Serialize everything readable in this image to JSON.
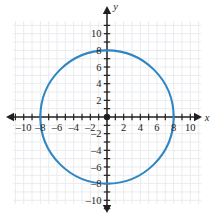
{
  "figure": {
    "title": "",
    "background_color": "#ffffff"
  },
  "chart_data": {
    "type": "scatter",
    "title": "",
    "subtitle": "",
    "xlabel": "x",
    "ylabel": "y",
    "xlim": [
      -11.2,
      11.2
    ],
    "ylim": [
      -11.2,
      11.2
    ],
    "grid": true,
    "grid_color": "#e9ebef",
    "grid_step": 1,
    "legend": null,
    "axis_color": "#231f20",
    "curve_color": "#2f86c2",
    "curve_width": 2.1,
    "origin_marker": {
      "x": 0,
      "y": 0,
      "color": "#231f20",
      "radius_px": 3.2
    },
    "shapes": [
      {
        "name": "circle",
        "kind": "circle",
        "center_x": 0,
        "center_y": 0,
        "radius": 8,
        "equation": "x^2 + y^2 = 64",
        "stroke": "#2f86c2",
        "fill": "none",
        "x_intercepts": [
          -8,
          8
        ],
        "y_intercepts": [
          -8,
          8
        ]
      }
    ],
    "x_ticks": [
      -10,
      -8,
      -6,
      -4,
      -2,
      2,
      4,
      6,
      8,
      10
    ],
    "x_tick_labels": [
      "–10",
      "–8",
      "–6",
      "–4",
      "–2",
      "2",
      "4",
      "6",
      "8",
      "10"
    ],
    "y_ticks": [
      10,
      8,
      6,
      4,
      2,
      -2,
      -4,
      -6,
      -8,
      -10
    ],
    "y_tick_labels": [
      "10",
      "8",
      "6",
      "4",
      "2",
      "–2",
      "–4",
      "–6",
      "–8",
      "–10"
    ],
    "minor_tick_positions": [
      -10.5,
      -9.5,
      -8.5,
      -7.5,
      -6.5,
      -5.5,
      -4.5,
      -3.5,
      -2.5,
      -1.5,
      -0.5,
      0.5,
      1.5,
      2.5,
      3.5,
      4.5,
      5.5,
      6.5,
      7.5,
      8.5,
      9.5,
      10.5
    ],
    "arrows": [
      "left",
      "right",
      "up",
      "down"
    ]
  },
  "axes": {
    "x_axis_label": "x",
    "y_axis_label": "y"
  }
}
